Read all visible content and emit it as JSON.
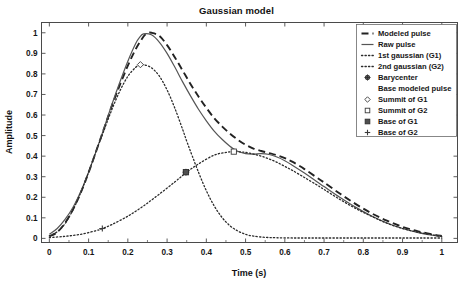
{
  "chart_data": {
    "type": "line",
    "title": "Gaussian model",
    "xlabel": "Time (s)",
    "ylabel": "Amplitude",
    "xlim": [
      -0.02,
      1.04
    ],
    "ylim": [
      -0.02,
      1.05
    ],
    "grid": false,
    "legend_position": "top-right",
    "xticks": [
      "0",
      "0.1",
      "0.2",
      "0.3",
      "0.4",
      "0.5",
      "0.6",
      "0.7",
      "0.8",
      "0.9",
      "1"
    ],
    "xtick_values": [
      0,
      0.1,
      0.2,
      0.3,
      0.4,
      0.5,
      0.6,
      0.7,
      0.8,
      0.9,
      1
    ],
    "yticks": [
      "0",
      "0.1",
      "0.2",
      "0.3",
      "0.4",
      "0.5",
      "0.6",
      "0.7",
      "0.8",
      "0.9",
      "1"
    ],
    "ytick_values": [
      0,
      0.1,
      0.2,
      0.3,
      0.4,
      0.5,
      0.6,
      0.7,
      0.8,
      0.9,
      1
    ],
    "series": [
      {
        "name": "Modeled pulse",
        "style": "dashed",
        "color": "#222222",
        "x": [
          0.0,
          0.02,
          0.04,
          0.06,
          0.08,
          0.1,
          0.12,
          0.14,
          0.16,
          0.18,
          0.2,
          0.22,
          0.24,
          0.25,
          0.26,
          0.28,
          0.3,
          0.32,
          0.34,
          0.36,
          0.38,
          0.4,
          0.42,
          0.44,
          0.46,
          0.48,
          0.5,
          0.52,
          0.54,
          0.56,
          0.58,
          0.6,
          0.62,
          0.65,
          0.68,
          0.7,
          0.74,
          0.78,
          0.82,
          0.86,
          0.9,
          0.94,
          0.98,
          1.0
        ],
        "y": [
          0.01,
          0.03,
          0.075,
          0.14,
          0.222,
          0.32,
          0.428,
          0.538,
          0.648,
          0.748,
          0.84,
          0.92,
          0.982,
          0.998,
          1.0,
          0.985,
          0.94,
          0.88,
          0.815,
          0.75,
          0.69,
          0.635,
          0.585,
          0.545,
          0.51,
          0.48,
          0.455,
          0.437,
          0.425,
          0.415,
          0.404,
          0.39,
          0.372,
          0.337,
          0.298,
          0.272,
          0.218,
          0.168,
          0.123,
          0.086,
          0.056,
          0.034,
          0.018,
          0.012
        ]
      },
      {
        "name": "Raw pulse",
        "style": "solid",
        "color": "#555555",
        "x": [
          0.0,
          0.02,
          0.04,
          0.06,
          0.08,
          0.1,
          0.12,
          0.14,
          0.16,
          0.18,
          0.2,
          0.22,
          0.23,
          0.24,
          0.26,
          0.28,
          0.3,
          0.32,
          0.34,
          0.36,
          0.38,
          0.4,
          0.42,
          0.44,
          0.46,
          0.47,
          0.48,
          0.5,
          0.52,
          0.54,
          0.56,
          0.58,
          0.6,
          0.62,
          0.65,
          0.68,
          0.7,
          0.74,
          0.78,
          0.82,
          0.86,
          0.9,
          0.94,
          0.98,
          1.0
        ],
        "y": [
          0.02,
          0.048,
          0.092,
          0.15,
          0.228,
          0.322,
          0.428,
          0.54,
          0.655,
          0.762,
          0.862,
          0.948,
          0.978,
          0.995,
          0.99,
          0.955,
          0.9,
          0.832,
          0.76,
          0.692,
          0.628,
          0.572,
          0.522,
          0.482,
          0.448,
          0.435,
          0.424,
          0.412,
          0.41,
          0.412,
          0.408,
          0.396,
          0.378,
          0.355,
          0.318,
          0.278,
          0.252,
          0.2,
          0.152,
          0.11,
          0.075,
          0.048,
          0.028,
          0.014,
          0.01
        ]
      },
      {
        "name": "1st gaussian (G1)",
        "style": "dotted",
        "color": "#2b2b2b",
        "x": [
          0.0,
          0.02,
          0.04,
          0.06,
          0.08,
          0.1,
          0.12,
          0.14,
          0.16,
          0.18,
          0.2,
          0.22,
          0.23,
          0.24,
          0.26,
          0.28,
          0.3,
          0.32,
          0.34,
          0.35,
          0.36,
          0.38,
          0.4,
          0.42,
          0.44,
          0.46,
          0.48,
          0.5,
          0.52,
          0.55,
          0.58,
          0.62,
          0.66,
          0.7,
          0.75,
          0.8,
          0.85,
          0.9,
          0.95,
          1.0
        ],
        "y": [
          0.012,
          0.032,
          0.072,
          0.138,
          0.222,
          0.322,
          0.428,
          0.53,
          0.63,
          0.718,
          0.788,
          0.832,
          0.843,
          0.845,
          0.83,
          0.79,
          0.722,
          0.632,
          0.528,
          0.473,
          0.422,
          0.322,
          0.232,
          0.158,
          0.102,
          0.062,
          0.036,
          0.02,
          0.011,
          0.005,
          0.003,
          0.002,
          0.002,
          0.002,
          0.002,
          0.002,
          0.002,
          0.002,
          0.002,
          0.002
        ]
      },
      {
        "name": "2nd gaussian (G2)",
        "style": "dotted",
        "color": "#2b2b2b",
        "x": [
          0.0,
          0.04,
          0.08,
          0.12,
          0.135,
          0.16,
          0.2,
          0.24,
          0.28,
          0.32,
          0.35,
          0.38,
          0.42,
          0.45,
          0.47,
          0.49,
          0.5,
          0.52,
          0.54,
          0.56,
          0.58,
          0.6,
          0.62,
          0.65,
          0.68,
          0.7,
          0.74,
          0.78,
          0.82,
          0.86,
          0.9,
          0.94,
          0.98,
          1.0
        ],
        "y": [
          0.004,
          0.01,
          0.02,
          0.038,
          0.048,
          0.068,
          0.108,
          0.158,
          0.215,
          0.275,
          0.322,
          0.362,
          0.405,
          0.418,
          0.422,
          0.42,
          0.418,
          0.41,
          0.4,
          0.386,
          0.37,
          0.35,
          0.33,
          0.296,
          0.262,
          0.238,
          0.19,
          0.146,
          0.108,
          0.074,
          0.048,
          0.03,
          0.016,
          0.01
        ]
      }
    ],
    "markers": [
      {
        "name": "Barycenter",
        "glyph": "circle-filled",
        "x": 0.348,
        "y": 0.322
      },
      {
        "name": "Summit of G1",
        "glyph": "diamond",
        "x": 0.232,
        "y": 0.845
      },
      {
        "name": "Summit of G2",
        "glyph": "square",
        "x": 0.47,
        "y": 0.422
      },
      {
        "name": "Base of G1",
        "glyph": "square-filled",
        "x": 0.348,
        "y": 0.322
      },
      {
        "name": "Base of G2",
        "glyph": "plus",
        "x": 0.135,
        "y": 0.048
      }
    ],
    "legend_entries": [
      {
        "label": "Modeled pulse",
        "sample": "dashed-line"
      },
      {
        "label": "Raw pulse",
        "sample": "solid-line"
      },
      {
        "label": "1st gaussian (G1)",
        "sample": "dotted-line"
      },
      {
        "label": "2nd gaussian (G2)",
        "sample": "dotted-line"
      },
      {
        "label": "Barycenter",
        "sample": "circle-filled"
      },
      {
        "label": "Base modeled pulse",
        "sample": "none"
      },
      {
        "label": "Summit of G1",
        "sample": "diamond"
      },
      {
        "label": "Summit of G2",
        "sample": "square"
      },
      {
        "label": "Base of G1",
        "sample": "square-filled"
      },
      {
        "label": "Base of G2",
        "sample": "plus"
      }
    ]
  },
  "colors": {
    "background": "#ffffff",
    "axis": "#4a4a4a",
    "text": "#161616",
    "modeled": "#222222",
    "raw": "#555555",
    "gaussian": "#2b2b2b"
  }
}
